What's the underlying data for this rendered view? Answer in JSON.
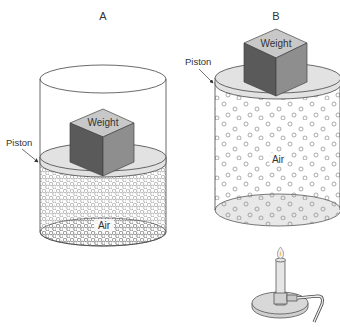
{
  "panels": [
    {
      "id": "A",
      "title": "A",
      "weight_label": "Weight",
      "piston_label": "Piston",
      "gas_label": "Air",
      "state": "compressed, unheated"
    },
    {
      "id": "B",
      "title": "B",
      "weight_label": "Weight",
      "piston_label": "Piston",
      "gas_label": "Air",
      "state": "expanded, heated by burner"
    }
  ],
  "colors": {
    "outline": "#444444",
    "piston_fill": "#e2e2e2",
    "cube_top": "#c8c8c8",
    "cube_left": "#5a5a5a",
    "cube_right": "#8e8e8e",
    "particle": "#888888",
    "burner_fill": "#d8d8d8"
  }
}
